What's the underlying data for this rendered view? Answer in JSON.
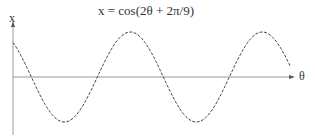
{
  "chart_data": {
    "type": "line",
    "title": "x = cos(2θ + 2π/9)",
    "xlabel": "θ",
    "ylabel": "x",
    "function": "cos(2*theta + 2*pi/9)",
    "x_range_periods": 2.1,
    "ylim": [
      -1,
      1
    ],
    "grid": false,
    "legend": false,
    "line_style": "dashed-dotted",
    "color": "#444444",
    "axis_color": "#999999"
  },
  "labels": {
    "title": "x = cos(2θ + 2π/9)",
    "x_axis": "θ",
    "y_axis": "x"
  }
}
